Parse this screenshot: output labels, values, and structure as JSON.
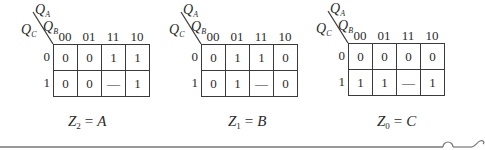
{
  "col_headers": [
    "00",
    "01",
    "11",
    "10"
  ],
  "row_headers": [
    "0",
    "1"
  ],
  "axis_labels": {
    "top": {
      "base": "Q",
      "sub": "A"
    },
    "mid": {
      "base": "Q",
      "sub": "B"
    },
    "left": {
      "base": "Q",
      "sub": "C"
    }
  },
  "maps": [
    {
      "name": "Z2",
      "cells": [
        [
          "0",
          "0",
          "1",
          "1"
        ],
        [
          "0",
          "0",
          "—",
          "1"
        ]
      ],
      "equation": {
        "lhs": "Z",
        "sub": "2",
        "op": "=",
        "rhs": "A"
      }
    },
    {
      "name": "Z1",
      "cells": [
        [
          "0",
          "1",
          "1",
          "0"
        ],
        [
          "0",
          "1",
          "—",
          "0"
        ]
      ],
      "equation": {
        "lhs": "Z",
        "sub": "1",
        "op": "=",
        "rhs": "B"
      }
    },
    {
      "name": "Z0",
      "cells": [
        [
          "0",
          "0",
          "0",
          "0"
        ],
        [
          "1",
          "1",
          "—",
          "1"
        ]
      ],
      "equation": {
        "lhs": "Z",
        "sub": "0",
        "op": "=",
        "rhs": "C"
      }
    }
  ],
  "colors": {
    "line": "#3a3a3a",
    "text": "#2a2a2a",
    "rule": "#777777"
  }
}
